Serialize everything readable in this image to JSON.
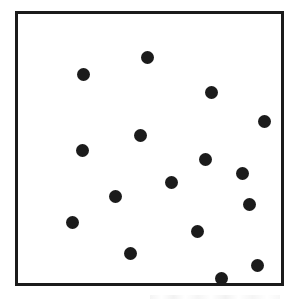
{
  "figure": {
    "title": "",
    "background_color": "#ffffff",
    "width": 297,
    "height": 303
  },
  "frame": {
    "name": "plot-frame",
    "x": 15,
    "y": 11,
    "width": 269,
    "height": 275,
    "border_width": 3,
    "border_color": "#1b1b1b",
    "fill_color": "#ffffff"
  },
  "marker_style": {
    "shape": "circle",
    "diameter": 13,
    "color": "#1b1b1b"
  },
  "chart_data": {
    "type": "scatter",
    "title": "",
    "subtitle": "",
    "xlabel": "",
    "ylabel": "",
    "xlim": [
      0,
      269
    ],
    "ylim": [
      0,
      275
    ],
    "grid": false,
    "legend": null,
    "axis_ticks": false,
    "tick_labels": [],
    "annotations": [],
    "point_count": 16,
    "series": [
      {
        "name": "points",
        "marker": "filled-circle",
        "color": "#1b1b1b",
        "size": 13,
        "points": [
          {
            "x": 132,
            "y": 44
          },
          {
            "x": 67,
            "y": 62
          },
          {
            "x": 198,
            "y": 80
          },
          {
            "x": 252,
            "y": 110
          },
          {
            "x": 125,
            "y": 124
          },
          {
            "x": 66,
            "y": 140
          },
          {
            "x": 192,
            "y": 149
          },
          {
            "x": 230,
            "y": 163
          },
          {
            "x": 157,
            "y": 172
          },
          {
            "x": 100,
            "y": 187
          },
          {
            "x": 237,
            "y": 195
          },
          {
            "x": 56,
            "y": 213
          },
          {
            "x": 184,
            "y": 222
          },
          {
            "x": 115,
            "y": 245
          },
          {
            "x": 245,
            "y": 257
          },
          {
            "x": 208,
            "y": 270
          }
        ]
      }
    ]
  }
}
